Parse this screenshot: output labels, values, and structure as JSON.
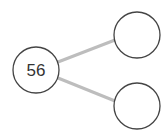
{
  "diagram": {
    "type": "number-bond",
    "root": {
      "label": "56",
      "cx": 36,
      "cy": 70,
      "r": 23
    },
    "children": [
      {
        "label": "",
        "cx": 137,
        "cy": 35,
        "r": 23
      },
      {
        "label": "",
        "cx": 137,
        "cy": 106,
        "r": 23
      }
    ],
    "colors": {
      "circle_stroke": "#444444",
      "circle_fill": "#ffffff",
      "connector": "#bdbdbd",
      "text": "#333333"
    }
  }
}
